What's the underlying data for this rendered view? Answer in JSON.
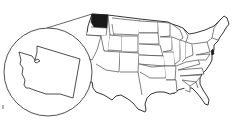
{
  "figure": {
    "title": "Location of Washington State in the United States",
    "highlighted_state": "Washington",
    "inset_state": "Washington",
    "colors": {
      "highlight": "#1a1a1a",
      "outline": "#222222",
      "background": "#ffffff"
    }
  }
}
